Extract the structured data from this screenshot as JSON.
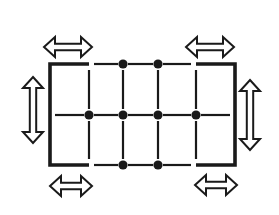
{
  "diagram": {
    "stroke_color": "#1a1a1a",
    "background_color": "#ffffff",
    "rectangle": {
      "left": 50,
      "right": 235,
      "top": 64,
      "bottom": 165
    },
    "grid": {
      "vertical_lines_x": [
        89,
        123,
        158,
        196
      ],
      "middle_line_y": 115
    },
    "nodes": [
      {
        "x": 123,
        "y": 64
      },
      {
        "x": 158,
        "y": 64
      },
      {
        "x": 89,
        "y": 115
      },
      {
        "x": 123,
        "y": 115
      },
      {
        "x": 158,
        "y": 115
      },
      {
        "x": 196,
        "y": 115
      },
      {
        "x": 123,
        "y": 165
      },
      {
        "x": 158,
        "y": 165
      }
    ],
    "arrows": [
      {
        "name": "top-left-horizontal",
        "orientation": "horizontal",
        "cx": 68,
        "cy": 47,
        "length": 48
      },
      {
        "name": "top-right-horizontal",
        "orientation": "horizontal",
        "cx": 210,
        "cy": 47,
        "length": 48
      },
      {
        "name": "bottom-left-horizontal",
        "orientation": "horizontal",
        "cx": 71,
        "cy": 186,
        "length": 42
      },
      {
        "name": "bottom-right-horizontal",
        "orientation": "horizontal",
        "cx": 216,
        "cy": 185,
        "length": 42
      },
      {
        "name": "left-vertical",
        "orientation": "vertical",
        "cx": 33,
        "cy": 110,
        "length": 66
      },
      {
        "name": "right-vertical",
        "orientation": "vertical",
        "cx": 250,
        "cy": 115,
        "length": 70
      }
    ]
  }
}
